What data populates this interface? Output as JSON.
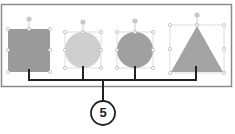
{
  "callout": {
    "number": "5"
  },
  "shapes": [
    {
      "name": "square",
      "fill": "#9b9b9b"
    },
    {
      "name": "light-circle",
      "fill": "#cfcfcf"
    },
    {
      "name": "dark-circle",
      "fill": "#a0a0a0"
    },
    {
      "name": "triangle",
      "fill": "#a3a3a3"
    }
  ],
  "colors": {
    "frame": "#8a8a8a",
    "connector": "#222222",
    "handle": "#b8b8b8"
  }
}
